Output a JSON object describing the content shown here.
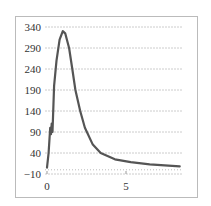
{
  "chart_data": {
    "type": "line",
    "title": "",
    "xlabel": "",
    "ylabel": "",
    "xlim": [
      0,
      8.6
    ],
    "ylim": [
      -10,
      340
    ],
    "grid": true,
    "legend": null,
    "x_ticks": [
      0,
      5
    ],
    "y_ticks": [
      -10,
      40,
      90,
      140,
      190,
      240,
      290,
      340
    ],
    "series": [
      {
        "name": "curve",
        "color": "#555555",
        "x": [
          0.0,
          0.1,
          0.2,
          0.25,
          0.3,
          0.35,
          0.45,
          0.6,
          0.8,
          1.0,
          1.15,
          1.4,
          1.6,
          1.8,
          2.1,
          2.4,
          2.9,
          3.4,
          4.3,
          5.3,
          6.5,
          8.4
        ],
        "values": [
          5,
          40,
          100,
          85,
          110,
          90,
          200,
          260,
          310,
          330,
          325,
          290,
          240,
          190,
          140,
          100,
          60,
          40,
          25,
          18,
          13,
          8
        ]
      }
    ]
  },
  "axes": {
    "x_tick_labels": [
      "0",
      "5"
    ],
    "y_tick_labels": [
      "340",
      "290",
      "240",
      "190",
      "140",
      "90",
      "40",
      "−10"
    ]
  },
  "colors": {
    "line": "#555555",
    "grid": "#cccccc",
    "border": "#bbbbbb"
  }
}
